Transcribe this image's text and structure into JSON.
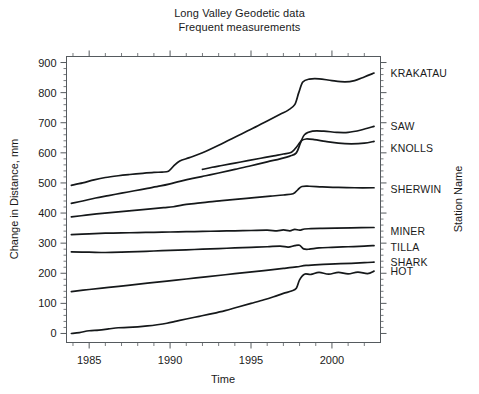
{
  "title": {
    "line1": "Long Valley Geodetic data",
    "line2": "Frequent measurements"
  },
  "axes": {
    "x_label": "Time",
    "y_label": "Change in Distance, mm",
    "right_label": "Station Name",
    "x_ticks": [
      "1985",
      "1990",
      "1995",
      "2000"
    ],
    "y_ticks": [
      "0",
      "100",
      "200",
      "300",
      "400",
      "500",
      "600",
      "700",
      "800",
      "900"
    ]
  },
  "stations": [
    {
      "name": "KRAKATAU",
      "label_value": 865
    },
    {
      "name": "SAW",
      "label_value": 690
    },
    {
      "name": "KNOLLS",
      "label_value": 615
    },
    {
      "name": "SHERWIN",
      "label_value": 480
    },
    {
      "name": "MINER",
      "label_value": 340
    },
    {
      "name": "TILLA",
      "label_value": 288
    },
    {
      "name": "SHARK",
      "label_value": 238
    },
    {
      "name": "HOT",
      "label_value": 208
    }
  ],
  "colors": {
    "line": "#15181a",
    "axis": "#555a5e",
    "background": "#ffffff",
    "text": "#1a1a1a"
  },
  "chart_data": {
    "type": "line",
    "xlabel": "Time",
    "ylabel": "Change in Distance, mm",
    "right_axis_label": "Station Name",
    "xlim": [
      1983.6,
      2003.0
    ],
    "ylim": [
      -30,
      920
    ],
    "grid": false,
    "legend": "right-axis station names",
    "x_major_ticks": [
      1985,
      1990,
      1995,
      2000
    ],
    "x_minor_tick_interval": 1,
    "y_major_ticks": [
      0,
      100,
      200,
      300,
      400,
      500,
      600,
      700,
      800,
      900
    ],
    "series": [
      {
        "name": "KRAKATAU",
        "x": [
          1983.9,
          1984.6,
          1985.3,
          1986.0,
          1986.8,
          1987.5,
          1988.3,
          1989.0,
          1989.5,
          1989.9,
          1990.2,
          1990.6,
          1991.2,
          1992.0,
          1993.0,
          1994.0,
          1995.0,
          1996.0,
          1996.8,
          1997.3,
          1997.7,
          1997.95,
          1998.2,
          1998.6,
          1999.2,
          2000.0,
          2000.8,
          2001.4,
          2002.0,
          2002.6
        ],
        "y": [
          492,
          500,
          510,
          518,
          524,
          528,
          532,
          535,
          536,
          539,
          555,
          573,
          584,
          600,
          625,
          652,
          678,
          706,
          728,
          742,
          760,
          800,
          835,
          845,
          846,
          840,
          836,
          840,
          852,
          865
        ]
      },
      {
        "name": "SAW",
        "x": [
          1983.9,
          1984.6,
          1985.4,
          1986.2,
          1987.0,
          1987.8,
          1988.6,
          1989.4,
          1990.0,
          1990.6,
          1991.4,
          1992.2,
          1993.0,
          1994.0,
          1995.0,
          1996.0,
          1996.8,
          1997.4,
          1997.8,
          1998.05,
          1998.3,
          1998.8,
          1999.5,
          2000.3,
          2001.0,
          2001.8,
          2002.6
        ],
        "y": [
          432,
          440,
          450,
          458,
          466,
          474,
          482,
          490,
          497,
          505,
          515,
          524,
          533,
          545,
          557,
          570,
          580,
          589,
          600,
          632,
          660,
          672,
          672,
          668,
          668,
          676,
          688
        ]
      },
      {
        "name": "KNOLLS",
        "x": [
          1992.0,
          1992.6,
          1993.2,
          1994.0,
          1994.8,
          1995.6,
          1996.4,
          1997.0,
          1997.5,
          1997.85,
          1998.1,
          1998.4,
          1998.9,
          1999.6,
          2000.4,
          2001.2,
          2002.0,
          2002.6
        ],
        "y": [
          545,
          552,
          558,
          566,
          574,
          582,
          590,
          596,
          602,
          622,
          640,
          646,
          644,
          638,
          632,
          630,
          632,
          638
        ]
      },
      {
        "name": "SHERWIN",
        "x": [
          1983.9,
          1984.8,
          1985.8,
          1986.8,
          1987.8,
          1988.8,
          1989.6,
          1990.2,
          1990.8,
          1991.6,
          1992.4,
          1993.2,
          1994.2,
          1995.2,
          1996.2,
          1997.0,
          1997.6,
          1997.9,
          1998.15,
          1998.6,
          1999.4,
          2000.4,
          2001.4,
          2002.6
        ],
        "y": [
          387,
          393,
          399,
          404,
          409,
          414,
          418,
          421,
          427,
          432,
          437,
          441,
          446,
          451,
          456,
          460,
          464,
          478,
          488,
          489,
          487,
          485,
          484,
          484
        ]
      },
      {
        "name": "MINER",
        "x": [
          1983.9,
          1985.0,
          1986.0,
          1987.0,
          1988.0,
          1989.0,
          1990.0,
          1991.0,
          1992.0,
          1993.0,
          1994.0,
          1995.0,
          1996.0,
          1996.6,
          1997.0,
          1997.4,
          1997.7,
          1998.0,
          1998.3,
          1998.7,
          1999.4,
          2000.2,
          2001.2,
          2002.6
        ],
        "y": [
          328,
          331,
          333,
          334,
          335,
          336,
          337,
          338,
          339,
          340,
          341,
          342,
          343,
          341,
          344,
          341,
          346,
          343,
          347,
          348,
          349,
          350,
          351,
          352
        ]
      },
      {
        "name": "TILLA",
        "x": [
          1983.9,
          1985.0,
          1986.0,
          1987.0,
          1988.0,
          1989.0,
          1990.0,
          1991.0,
          1992.0,
          1993.0,
          1994.0,
          1995.0,
          1996.0,
          1996.8,
          1997.3,
          1997.7,
          1998.0,
          1998.25,
          1998.6,
          1999.2,
          2000.0,
          2001.0,
          2002.0,
          2002.6
        ],
        "y": [
          271,
          270,
          269,
          270,
          272,
          274,
          276,
          278,
          280,
          282,
          284,
          286,
          288,
          290,
          287,
          292,
          293,
          281,
          280,
          284,
          286,
          288,
          290,
          292
        ]
      },
      {
        "name": "SHARK",
        "x": [
          1983.9,
          1985.0,
          1986.2,
          1987.4,
          1988.6,
          1989.8,
          1991.0,
          1992.2,
          1993.4,
          1994.6,
          1995.8,
          1997.0,
          1997.8,
          1998.4,
          1999.2,
          2000.2,
          2001.2,
          2002.0,
          2002.6
        ],
        "y": [
          139,
          146,
          153,
          160,
          167,
          174,
          181,
          188,
          195,
          202,
          209,
          216,
          221,
          226,
          229,
          231,
          233,
          235,
          237
        ]
      },
      {
        "name": "HOT",
        "x": [
          1983.9,
          1984.4,
          1985.0,
          1985.6,
          1986.2,
          1986.8,
          1987.4,
          1988.0,
          1988.6,
          1989.2,
          1989.8,
          1990.4,
          1991.0,
          1991.8,
          1992.6,
          1993.4,
          1994.2,
          1995.0,
          1995.8,
          1996.4,
          1997.0,
          1997.5,
          1997.8,
          1998.0,
          1998.3,
          1998.7,
          1999.2,
          1999.8,
          2000.4,
          2001.0,
          2001.6,
          2002.2,
          2002.6
        ],
        "y": [
          0,
          3,
          9,
          11,
          15,
          19,
          20,
          22,
          25,
          29,
          34,
          41,
          48,
          57,
          66,
          76,
          88,
          100,
          112,
          122,
          133,
          141,
          150,
          178,
          197,
          196,
          203,
          197,
          203,
          198,
          204,
          199,
          207
        ]
      }
    ]
  }
}
